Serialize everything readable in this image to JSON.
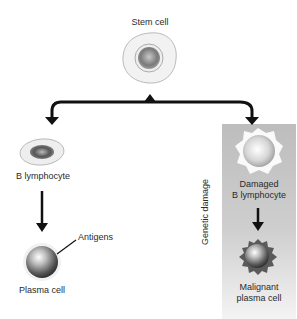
{
  "diagram": {
    "nodes": {
      "stem_cell": {
        "label": "Stem cell"
      },
      "b_lymphocyte": {
        "label": "B lymphocyte"
      },
      "plasma_cell": {
        "label": "Plasma cell"
      },
      "antigens": {
        "label": "Antigens"
      },
      "damaged_b_lymphocyte": {
        "line1": "Damaged",
        "line2": "B lymphocyte"
      },
      "malignant_plasma_cell": {
        "line1": "Malignant",
        "line2": "plasma cell"
      }
    },
    "side_label": "Genetic damage",
    "colors": {
      "arrow": "#111111",
      "panel": "#c4c4c4"
    }
  }
}
